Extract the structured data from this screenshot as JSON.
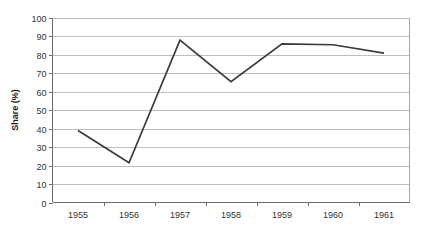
{
  "chart_data": {
    "type": "line",
    "title": "",
    "subtitle": "",
    "xlabel": "",
    "ylabel": "Share (%)",
    "categories": [
      "1955",
      "1956",
      "1957",
      "1958",
      "1959",
      "1960",
      "1961"
    ],
    "values": [
      39,
      21.5,
      88,
      65.5,
      86,
      85.5,
      81
    ],
    "series": [
      {
        "name": "Share",
        "values": [
          39,
          21.5,
          88,
          65.5,
          86,
          85.5,
          81
        ]
      }
    ],
    "ylim": [
      0,
      100
    ],
    "ytick_labels": [
      "0",
      "10",
      "20",
      "30",
      "40",
      "50",
      "60",
      "70",
      "80",
      "90",
      "100"
    ],
    "ytick_values": [
      0,
      10,
      20,
      30,
      40,
      50,
      60,
      70,
      80,
      90,
      100
    ],
    "xtick_labels": [
      "1955",
      "1956",
      "1957",
      "1958",
      "1959",
      "1960",
      "1961"
    ],
    "grid": "horizontal",
    "legend": "none",
    "legend_position": "",
    "annotations": [],
    "colors": {
      "line": "#3b3b3b",
      "gridline": "#bfbfbf",
      "axis": "#6d6d6d",
      "plot_border": "#a6a6a6",
      "text": "#333333",
      "title_text": "#231f20",
      "background": "#ffffff"
    }
  },
  "axis": {
    "y_title": "Share (%)"
  }
}
